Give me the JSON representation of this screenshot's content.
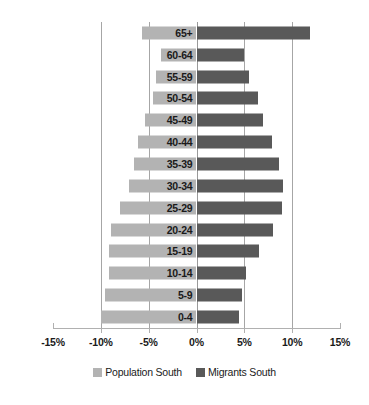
{
  "chart_data": {
    "type": "bar",
    "title": "",
    "subtitle": "",
    "xlabel": "",
    "ylabel": "",
    "orientation": "horizontal",
    "style": "population-pyramid",
    "grid": true,
    "legend_position": "bottom",
    "xlim": [
      -15,
      15
    ],
    "xticks": [
      -15,
      -10,
      -5,
      0,
      5,
      10,
      15
    ],
    "xtick_labels": [
      "-15%",
      "-10%",
      "-5%",
      "0%",
      "5%",
      "10%",
      "15%"
    ],
    "categories": [
      "0-4",
      "5-9",
      "10-14",
      "15-19",
      "20-24",
      "25-29",
      "30-34",
      "35-39",
      "40-44",
      "45-49",
      "50-54",
      "55-59",
      "60-64",
      "65+"
    ],
    "categories_top_to_bottom": [
      "65+",
      "60-64",
      "55-59",
      "50-54",
      "45-49",
      "40-44",
      "35-39",
      "30-34",
      "25-29",
      "20-24",
      "15-19",
      "10-14",
      "5-9",
      "0-4"
    ],
    "series": [
      {
        "name": "Population South",
        "color": "#b3b3b3",
        "side": "left",
        "values_top_to_bottom": [
          -5.7,
          -3.7,
          -4.2,
          -4.5,
          -5.4,
          -6.1,
          -6.5,
          -7.1,
          -8.0,
          -8.9,
          -9.1,
          -9.1,
          -9.6,
          -10.0
        ]
      },
      {
        "name": "Migrants South",
        "color": "#595959",
        "side": "right",
        "values_top_to_bottom": [
          11.9,
          5.0,
          5.5,
          6.4,
          7.0,
          7.9,
          8.6,
          9.0,
          8.9,
          8.0,
          6.5,
          5.2,
          4.8,
          4.4
        ]
      }
    ]
  },
  "legend": {
    "entries": [
      {
        "label": "Population South",
        "color": "#b3b3b3"
      },
      {
        "label": "Migrants South",
        "color": "#595959"
      }
    ]
  }
}
